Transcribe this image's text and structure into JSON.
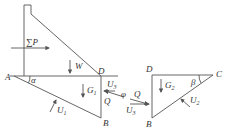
{
  "diagram": {
    "type": "dam stability force diagram",
    "colors": {
      "line": "#555555",
      "text": "#333333",
      "background": "#ffffff"
    },
    "left_figure": {
      "points": {
        "A": "A",
        "B": "B",
        "D": "D"
      },
      "forces": {
        "water_pressure": "∑P",
        "weight": "W",
        "block_weight": "G",
        "block_weight_sub": "1",
        "uplift": "U",
        "uplift_sub": "1",
        "side_uplift": "U",
        "side_uplift_sub": "3",
        "thrust": "Q"
      },
      "angle": "α"
    },
    "middle": {
      "thrust": "Q",
      "uplift": "U",
      "uplift_sub": "3",
      "angle": "φ"
    },
    "right_figure": {
      "points": {
        "D": "D",
        "C": "C",
        "B": "B"
      },
      "forces": {
        "block_weight": "G",
        "block_weight_sub": "2",
        "uplift": "U",
        "uplift_sub": "2"
      },
      "angle": "β"
    }
  }
}
